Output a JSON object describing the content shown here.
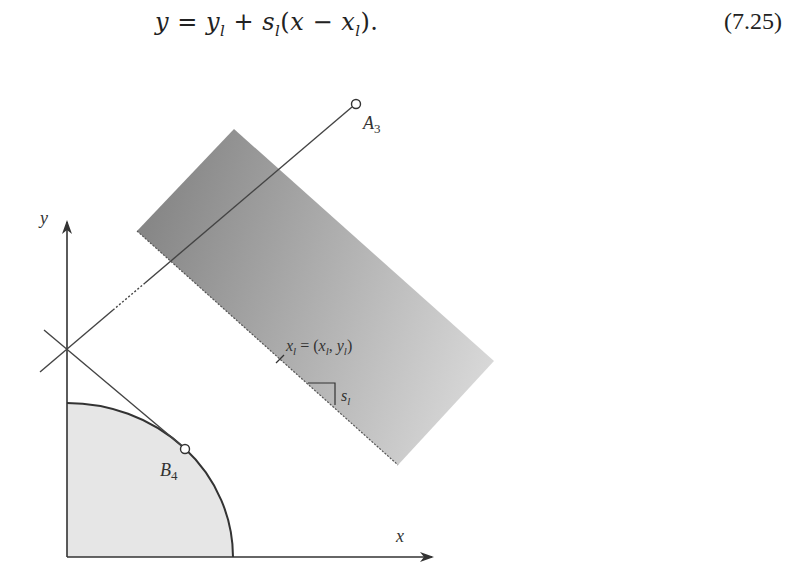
{
  "equation": {
    "text": "y = y",
    "parts": [
      "y",
      " = ",
      "y",
      "l",
      " + ",
      "s",
      "l",
      "(",
      "x",
      " − ",
      "x",
      "l",
      ")."
    ],
    "number": "(7.25)"
  },
  "diagram": {
    "axes": {
      "x_label": "x",
      "y_label": "y"
    },
    "points": {
      "a3": {
        "label": "A",
        "sub": "3"
      },
      "b4": {
        "label": "B",
        "sub": "4"
      }
    },
    "halfplane_label": {
      "lhs": "x",
      "lhs_sub": "l",
      "eq": " = (",
      "x": "x",
      "x_sub": "l",
      "comma": ", ",
      "y": "y",
      "y_sub": "l",
      "close": ")"
    },
    "slope_label": {
      "s": "s",
      "sub": "l"
    },
    "colors": {
      "halfplane_dark": "#8a8a8a",
      "halfplane_light": "#d4d4d4",
      "region_fill": "#e6e6e6",
      "stroke": "#333333"
    }
  }
}
